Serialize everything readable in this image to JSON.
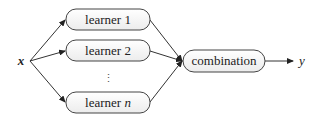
{
  "diagram": {
    "input_label": "x",
    "output_label": "y",
    "learners": [
      {
        "prefix": "learner",
        "index": "1"
      },
      {
        "prefix": "learner",
        "index": "2"
      },
      {
        "prefix": "learner",
        "index": "n"
      }
    ],
    "ellipsis": "⋮",
    "combiner_label": "combination",
    "colors": {
      "stroke": "#333333",
      "box_fill": "#f7f7f7",
      "text": "#222222"
    }
  }
}
